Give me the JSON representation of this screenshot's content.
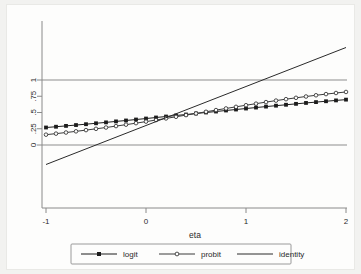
{
  "chart_data": {
    "type": "line",
    "title": "",
    "xlabel": "eta",
    "ylabel": "",
    "xlim": [
      -1,
      2
    ],
    "ylim": [
      -0.32,
      1.32
    ],
    "xticks": [
      "-1",
      "0",
      "1",
      "2"
    ],
    "xtick_values": [
      -1,
      0,
      1,
      2
    ],
    "yticks": [
      "0",
      ".25",
      ".5",
      ".75",
      "1"
    ],
    "ytick_values": [
      0,
      0.25,
      0.5,
      0.75,
      1
    ],
    "grid": false,
    "reference_lines": [
      0,
      1
    ],
    "legend_position": "bottom",
    "x": [
      -1,
      -0.9,
      -0.8,
      -0.7,
      -0.6,
      -0.5,
      -0.4,
      -0.3,
      -0.2,
      -0.1,
      0,
      0.1,
      0.2,
      0.3,
      0.4,
      0.5,
      0.6,
      0.7,
      0.8,
      0.9,
      1,
      1.1,
      1.2,
      1.3,
      1.4,
      1.5,
      1.6,
      1.7,
      1.8,
      1.9,
      2
    ],
    "series": [
      {
        "name": "logit",
        "marker": "filled-square",
        "color": "#1c1c1c",
        "values": [
          0.269,
          0.281,
          0.294,
          0.307,
          0.32,
          0.334,
          0.348,
          0.363,
          0.377,
          0.392,
          0.407,
          0.423,
          0.438,
          0.454,
          0.469,
          0.485,
          0.5,
          0.515,
          0.531,
          0.546,
          0.561,
          0.576,
          0.591,
          0.605,
          0.619,
          0.633,
          0.647,
          0.66,
          0.673,
          0.686,
          0.698
        ]
      },
      {
        "name": "probit",
        "marker": "open-circle",
        "color": "#3a3a3a",
        "values": [
          0.159,
          0.175,
          0.192,
          0.21,
          0.229,
          0.249,
          0.269,
          0.291,
          0.313,
          0.336,
          0.36,
          0.384,
          0.409,
          0.434,
          0.46,
          0.485,
          0.511,
          0.537,
          0.562,
          0.587,
          0.612,
          0.636,
          0.66,
          0.683,
          0.705,
          0.726,
          0.746,
          0.765,
          0.783,
          0.8,
          0.816
        ]
      },
      {
        "name": "identity",
        "marker": "none",
        "color": "#2a2a2a",
        "values": [
          -0.3,
          -0.24,
          -0.18,
          -0.12,
          -0.06,
          0.0,
          0.06,
          0.12,
          0.18,
          0.24,
          0.3,
          0.36,
          0.42,
          0.48,
          0.54,
          0.6,
          0.66,
          0.72,
          0.78,
          0.84,
          0.9,
          0.96,
          1.02,
          1.08,
          1.14,
          1.2,
          1.26,
          1.32,
          1.38,
          1.44,
          1.5
        ]
      }
    ],
    "legend": [
      {
        "label": "logit",
        "marker": "filled-square"
      },
      {
        "label": "probit",
        "marker": "open-circle"
      },
      {
        "label": "identity",
        "marker": "none"
      }
    ]
  }
}
